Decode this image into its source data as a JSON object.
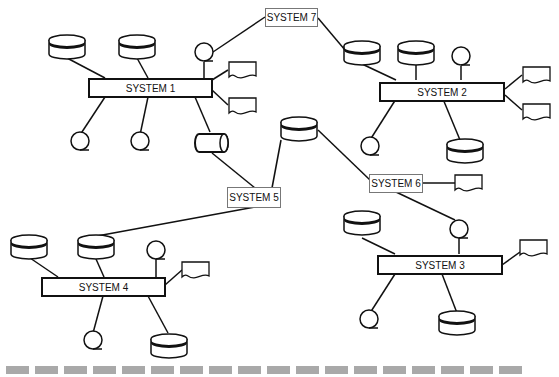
{
  "diagram": {
    "systems": [
      {
        "id": "s1",
        "label": "SYSTEM 1"
      },
      {
        "id": "s2",
        "label": "SYSTEM 2"
      },
      {
        "id": "s3",
        "label": "SYSTEM 3"
      },
      {
        "id": "s4",
        "label": "SYSTEM 4"
      }
    ],
    "links": [
      {
        "id": "s5",
        "label": "SYSTEM 5"
      },
      {
        "id": "s6",
        "label": "SYSTEM 6"
      },
      {
        "id": "s7",
        "label": "SYSTEM 7"
      }
    ],
    "icon_legend": {
      "disk": "disk-storage-icon",
      "tape": "magnetic-tape-icon",
      "document": "document-icon",
      "drum": "drum-storage-icon"
    },
    "colors": {
      "line": "#111111",
      "dash": "#a9a9a9",
      "label_border": "#777777"
    },
    "footer_dashes": 18
  }
}
